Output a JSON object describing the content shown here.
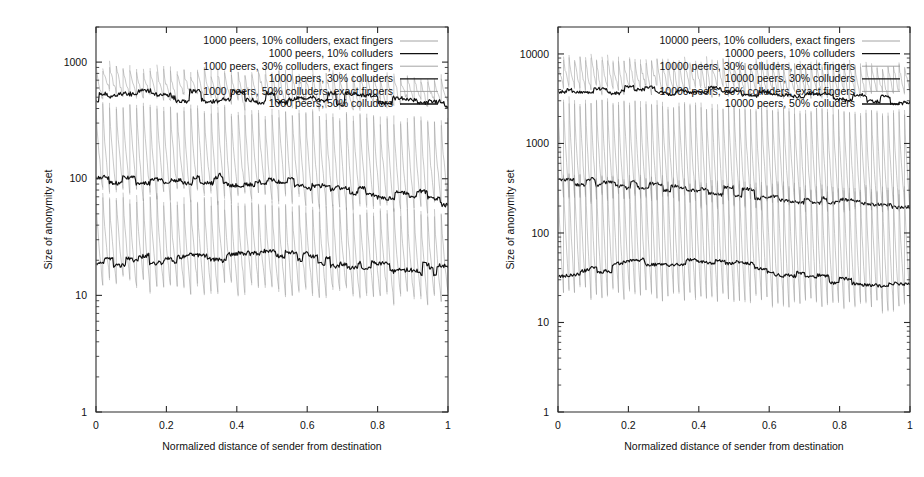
{
  "figure": {
    "panels": [
      "left",
      "right"
    ],
    "background": "#ffffff",
    "ink": "#111111",
    "light_ink": "#9a9a9a"
  },
  "chart_data": [
    {
      "id": "left",
      "type": "line",
      "title": "",
      "xlabel": "Normalized distance of sender from destination",
      "ylabel": "Size of anonymity set",
      "xscale": "linear",
      "yscale": "log",
      "xlim": [
        0,
        1
      ],
      "ylim": [
        1,
        2000
      ],
      "grid": false,
      "legend_position": "top-right-inside",
      "xticks": [
        0,
        0.2,
        0.4,
        0.6,
        0.8,
        1
      ],
      "xticklabels": [
        "0",
        "0.2",
        "0.4",
        "0.6",
        "0.8",
        "1"
      ],
      "yticks": [
        1,
        10,
        100,
        1000
      ],
      "yticklabels": [
        "1",
        "10",
        "100",
        "1000"
      ],
      "series": [
        {
          "name": "1000 peers, 10% colluders, exact fingers",
          "style": "light",
          "color": "#9a9a9a",
          "kind": "sawtooth-band",
          "band_top": 900,
          "band_bottom": 520,
          "decay": 0.8,
          "teeth": 52,
          "x": [
            0,
            1
          ]
        },
        {
          "name": "1000 peers, 10% colluders",
          "style": "dark",
          "color": "#111111",
          "kind": "noisy-step",
          "start": 520,
          "end": 450,
          "x": [
            0,
            0.25,
            0.5,
            0.75,
            1
          ],
          "values": [
            520,
            510,
            500,
            475,
            450
          ]
        },
        {
          "name": "1000 peers, 30% colluders, exact fingers",
          "style": "light",
          "color": "#9a9a9a",
          "kind": "sawtooth-band",
          "band_top": 430,
          "band_bottom": 78,
          "decay": 0.72,
          "teeth": 52,
          "x": [
            0,
            1
          ]
        },
        {
          "name": "1000 peers, 30% colluders",
          "style": "dark",
          "color": "#111111",
          "kind": "noisy-step",
          "start": 100,
          "end": 66,
          "x": [
            0,
            0.25,
            0.5,
            0.75,
            1
          ],
          "values": [
            100,
            98,
            95,
            80,
            66
          ]
        },
        {
          "name": "1000 peers, 50% colluders, exact fingers",
          "style": "light",
          "color": "#9a9a9a",
          "kind": "sawtooth-band",
          "band_top": 70,
          "band_bottom": 13,
          "decay": 0.7,
          "teeth": 52,
          "x": [
            0,
            1
          ]
        },
        {
          "name": "1000 peers, 50% colluders",
          "style": "dark",
          "color": "#111111",
          "kind": "noisy-step",
          "start": 18,
          "end": 16,
          "x": [
            0,
            0.25,
            0.5,
            0.75,
            1
          ],
          "values": [
            18,
            21,
            22,
            19,
            16
          ]
        }
      ]
    },
    {
      "id": "right",
      "type": "line",
      "title": "",
      "xlabel": "Normalized distance of sender from destination",
      "ylabel": "Size of anonymity set",
      "xscale": "linear",
      "yscale": "log",
      "xlim": [
        0,
        1
      ],
      "ylim": [
        1,
        20000
      ],
      "grid": false,
      "legend_position": "top-right-inside",
      "xticks": [
        0,
        0.2,
        0.4,
        0.6,
        0.8,
        1
      ],
      "xticklabels": [
        "0",
        "0.2",
        "0.4",
        "0.6",
        "0.8",
        "1"
      ],
      "yticks": [
        1,
        10,
        100,
        1000,
        10000
      ],
      "yticklabels": [
        "1",
        "10",
        "100",
        "1000",
        "10000"
      ],
      "series": [
        {
          "name": "10000 peers, 10% colluders, exact fingers",
          "style": "light",
          "color": "#9a9a9a",
          "kind": "sawtooth-band",
          "band_top": 9000,
          "band_bottom": 4200,
          "decay": 0.8,
          "teeth": 64,
          "x": [
            0,
            1
          ]
        },
        {
          "name": "10000 peers, 10% colluders",
          "style": "dark",
          "color": "#111111",
          "kind": "noisy-step",
          "start": 4200,
          "end": 3000,
          "x": [
            0,
            0.25,
            0.5,
            0.75,
            1
          ],
          "values": [
            4200,
            3900,
            3700,
            3300,
            3000
          ]
        },
        {
          "name": "10000 peers, 30% colluders, exact fingers",
          "style": "light",
          "color": "#9a9a9a",
          "kind": "sawtooth-band",
          "band_top": 3000,
          "band_bottom": 260,
          "decay": 0.7,
          "teeth": 64,
          "x": [
            0,
            1
          ]
        },
        {
          "name": "10000 peers, 30% colluders",
          "style": "dark",
          "color": "#111111",
          "kind": "noisy-step",
          "start": 380,
          "end": 200,
          "x": [
            0,
            0.25,
            0.5,
            0.75,
            1
          ],
          "values": [
            380,
            330,
            290,
            230,
            200
          ]
        },
        {
          "name": "10000 peers, 50% colluders, exact fingers",
          "style": "light",
          "color": "#9a9a9a",
          "kind": "sawtooth-band",
          "band_top": 430,
          "band_bottom": 22,
          "decay": 0.68,
          "teeth": 64,
          "x": [
            0,
            1
          ]
        },
        {
          "name": "10000 peers, 50% colluders",
          "style": "dark",
          "color": "#111111",
          "kind": "noisy-step",
          "start": 32,
          "end": 26,
          "x": [
            0,
            0.25,
            0.5,
            0.75,
            1
          ],
          "values": [
            32,
            47,
            44,
            30,
            26
          ]
        }
      ]
    }
  ]
}
